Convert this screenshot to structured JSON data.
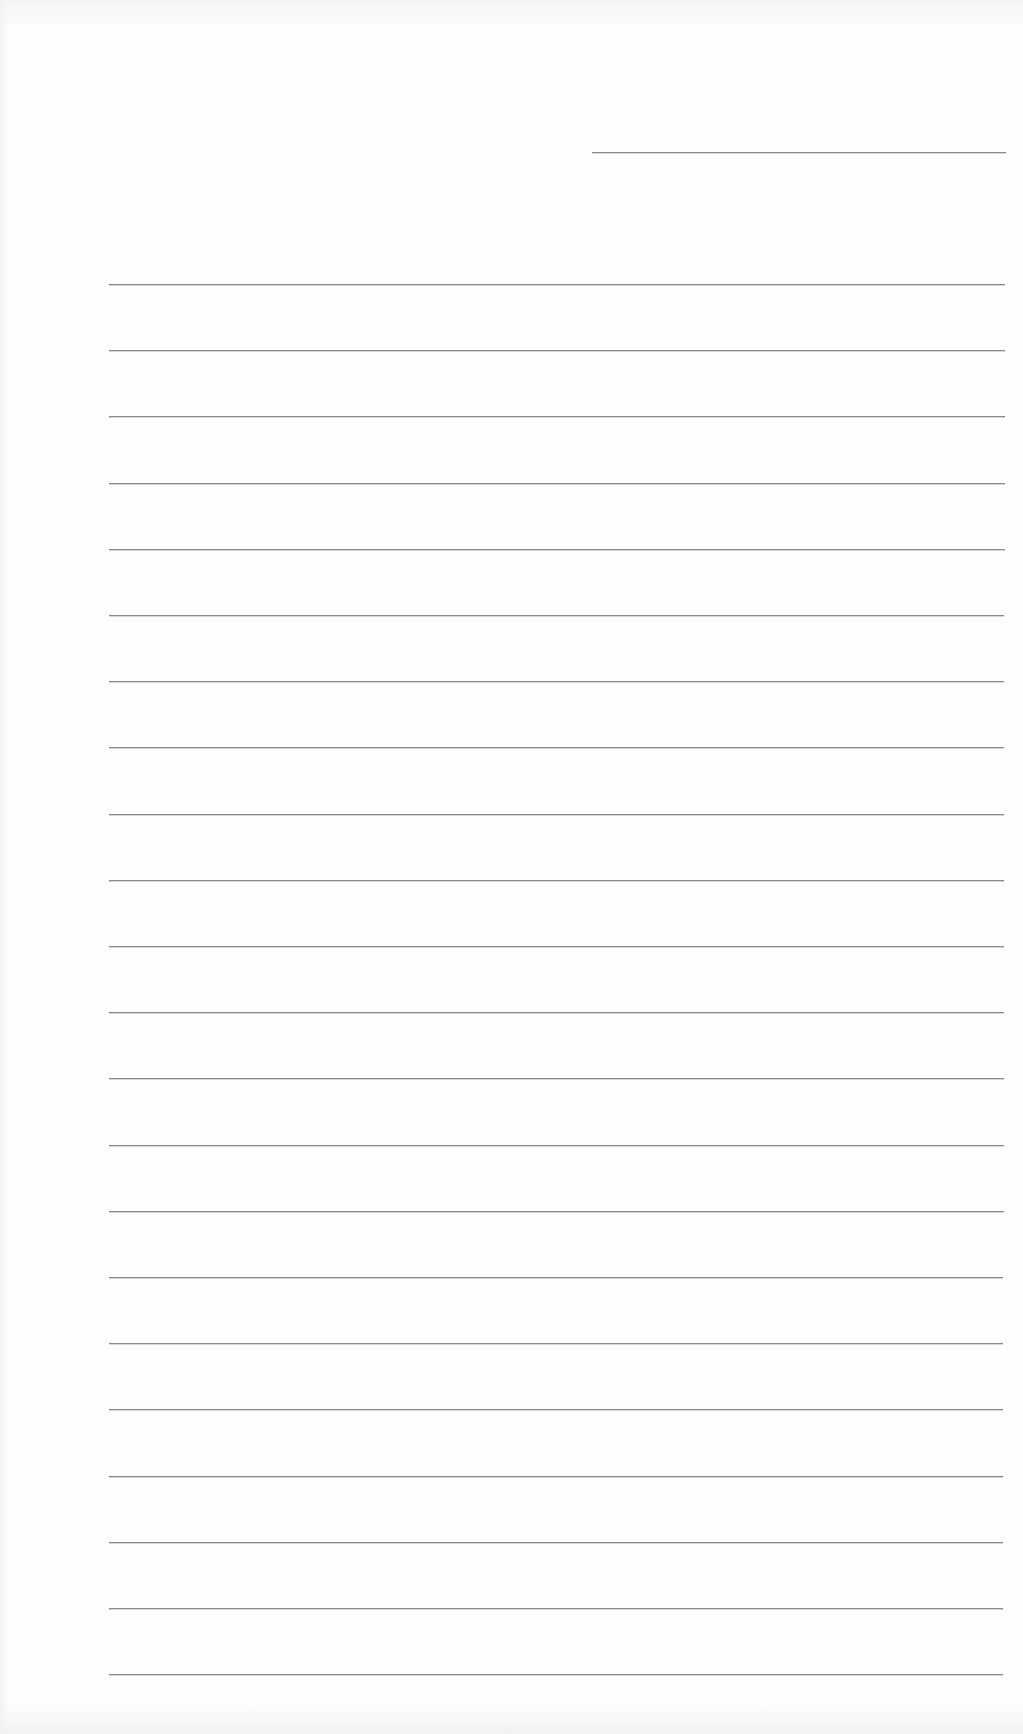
{
  "document": {
    "type": "lined-paper",
    "header_line": {
      "present": true
    },
    "ruled_lines": {
      "count": 22
    },
    "colors": {
      "paper": "#fefefe",
      "rule": "#8a8a8a"
    }
  }
}
